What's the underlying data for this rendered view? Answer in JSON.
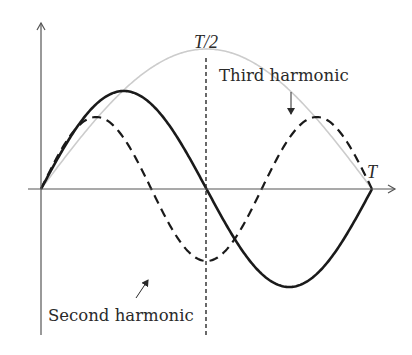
{
  "diagram": {
    "labels": {
      "half_period": "T/2",
      "period": "T",
      "third_harmonic": "Third harmonic",
      "second_harmonic": "Second harmonic"
    },
    "colors": {
      "axis": "#555555",
      "fundamental": "#c8c8c8",
      "second_harmonic": "#1a1a1a",
      "third_harmonic": "#1a1a1a",
      "text": "#2a2a2a"
    },
    "geometry": {
      "origin_x": 41,
      "axis_y": 189,
      "period_x": 372,
      "half_period_x": 206,
      "y_axis_top": 22,
      "y_axis_bottom": 335,
      "x_axis_right": 395
    },
    "curves": [
      {
        "name": "fundamental",
        "harmonic": 1,
        "amplitude_px": 140,
        "style": "solid-light"
      },
      {
        "name": "second_harmonic",
        "harmonic": 2,
        "amplitude_px": 98,
        "style": "solid-bold"
      },
      {
        "name": "third_harmonic",
        "harmonic": 3,
        "amplitude_px": 72,
        "style": "dashed"
      }
    ]
  }
}
